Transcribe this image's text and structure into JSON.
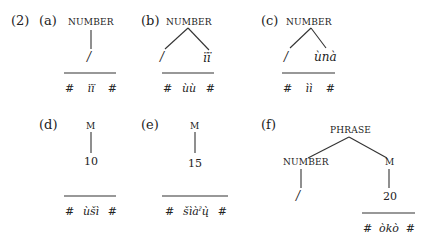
{
  "example_number": "(2)",
  "panels": [
    {
      "label": "(a)",
      "root": "NUMBER",
      "children": [
        "/"
      ],
      "form": [
        "#",
        "ïï",
        "#"
      ]
    },
    {
      "label": "(b)",
      "root": "NUMBER",
      "children": [
        "/",
        "ïï"
      ],
      "form": [
        "#",
        "ùù",
        "#"
      ]
    },
    {
      "label": "(c)",
      "root": "NUMBER",
      "children": [
        "/",
        "ùnà"
      ],
      "form": [
        "#",
        "ìì",
        "#"
      ]
    },
    {
      "label": "(d)",
      "root": "M",
      "children": [
        "10"
      ],
      "form": [
        "#",
        "ùšì",
        "#"
      ]
    },
    {
      "label": "(e)",
      "root": "M",
      "children": [
        "15"
      ],
      "form": [
        "#",
        "šìàˀų̀",
        "#"
      ]
    },
    {
      "label": "(f)",
      "root": "PHRASE",
      "children": [
        "NUMBER",
        "M"
      ],
      "grandchildren": [
        "/",
        "20"
      ],
      "form": [
        "#",
        "òkò",
        "#"
      ]
    }
  ],
  "colors": {
    "ink": "#222222",
    "background": "#ffffff"
  }
}
